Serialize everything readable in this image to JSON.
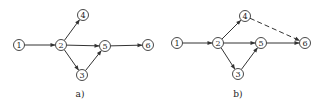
{
  "diagrams": [
    {
      "id": "a",
      "caption": "a)",
      "nodes": [
        {
          "label": "1",
          "x": 19,
          "y": 45
        },
        {
          "label": "2",
          "x": 61,
          "y": 45
        },
        {
          "label": "4",
          "x": 83,
          "y": 15
        },
        {
          "label": "5",
          "x": 105,
          "y": 46
        },
        {
          "label": "3",
          "x": 82,
          "y": 75
        },
        {
          "label": "6",
          "x": 148,
          "y": 45
        }
      ],
      "edges": [
        {
          "from": "1",
          "to": "2",
          "style": "solid"
        },
        {
          "from": "2",
          "to": "4",
          "style": "solid"
        },
        {
          "from": "2",
          "to": "5",
          "style": "solid"
        },
        {
          "from": "2",
          "to": "3",
          "style": "solid"
        },
        {
          "from": "3",
          "to": "5",
          "style": "solid"
        },
        {
          "from": "5",
          "to": "6",
          "style": "solid"
        }
      ]
    },
    {
      "id": "b",
      "caption": "b)",
      "nodes": [
        {
          "label": "1",
          "x": 177,
          "y": 43
        },
        {
          "label": "2",
          "x": 218,
          "y": 43
        },
        {
          "label": "4",
          "x": 245,
          "y": 16
        },
        {
          "label": "5",
          "x": 261,
          "y": 43
        },
        {
          "label": "3",
          "x": 238,
          "y": 74
        },
        {
          "label": "6",
          "x": 305,
          "y": 43
        }
      ],
      "edges": [
        {
          "from": "1",
          "to": "2",
          "style": "solid"
        },
        {
          "from": "2",
          "to": "4",
          "style": "solid"
        },
        {
          "from": "2",
          "to": "5",
          "style": "solid"
        },
        {
          "from": "2",
          "to": "3",
          "style": "solid"
        },
        {
          "from": "3",
          "to": "5",
          "style": "solid"
        },
        {
          "from": "5",
          "to": "6",
          "style": "solid"
        },
        {
          "from": "4",
          "to": "6",
          "style": "dashed"
        }
      ]
    }
  ],
  "captions": {
    "a": "a)",
    "b": "b)"
  },
  "node_glyphs": {
    "1": "①",
    "2": "②",
    "3": "③",
    "4": "④",
    "5": "⑤",
    "6": "⑥"
  }
}
